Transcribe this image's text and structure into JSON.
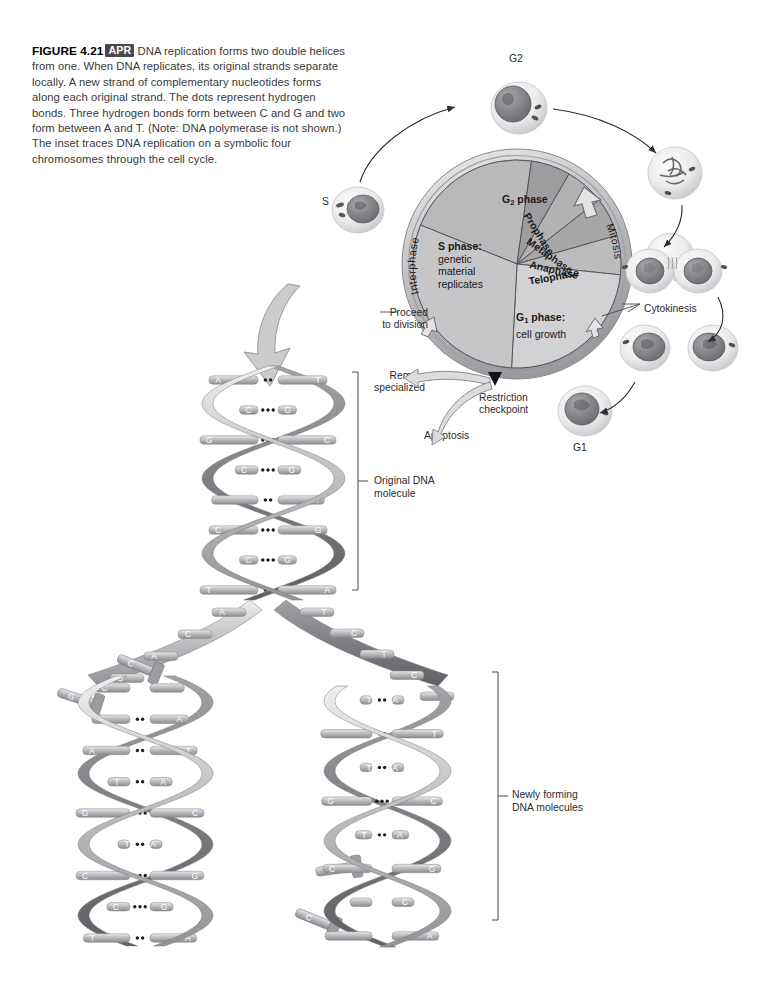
{
  "figure": {
    "number": "FIGURE 4.21",
    "badge": "APR",
    "caption": "DNA replication forms two double helices from one. When DNA replicates, its original strands separate locally. A new strand of complementary nucleotides forms along each original strand. The dots represent hydrogen bonds. Three hydrogen bonds form between C and G and two form between A and T. (Note: DNA polymerase is not shown.) The inset traces DNA replication on a symbolic four chromosomes through the cell cycle."
  },
  "cell_cycle": {
    "arcs": {
      "interphase": "Interphase",
      "mitosis": "Mitosis"
    },
    "sectors": [
      {
        "id": "g2",
        "name": "G",
        "sub": "2",
        "suffix": " phase",
        "start_deg": -68,
        "end_deg": 8,
        "fill": "#b9b9bb"
      },
      {
        "id": "prophase",
        "name": "Prophase",
        "start_deg": 8,
        "end_deg": 30,
        "fill": "#9d9da0"
      },
      {
        "id": "metaphase",
        "name": "Metaphase",
        "start_deg": 30,
        "end_deg": 52,
        "fill": "#b2b2b5"
      },
      {
        "id": "anaphase",
        "name": "Anaphase",
        "start_deg": 52,
        "end_deg": 74,
        "fill": "#a6a6a9"
      },
      {
        "id": "telophase",
        "name": "Telophase",
        "start_deg": 74,
        "end_deg": 96,
        "fill": "#bcbcbf"
      },
      {
        "id": "g1",
        "name": "G",
        "sub": "1",
        "suffix": " phase:",
        "detail": "cell growth",
        "start_deg": 96,
        "end_deg": 183,
        "fill": "#d2d2d4"
      },
      {
        "id": "s",
        "name": "S phase:",
        "detail": "genetic material replicates",
        "start_deg": 183,
        "end_deg": 292,
        "fill": "#c6c6c9"
      }
    ],
    "labels": {
      "g2_phase": "G",
      "g2_sub": "2",
      "g2_suffix": " phase",
      "s_phase_title": "S phase:",
      "s_phase_l1": "genetic",
      "s_phase_l2": "material",
      "s_phase_l3": "replicates",
      "g1_phase": "G",
      "g1_sub": "1",
      "g1_suffix": " phase:",
      "g1_detail": "cell growth",
      "prophase": "Prophase",
      "metaphase": "Metaphase",
      "anaphase": "Anaphase",
      "telophase": "Telophase"
    },
    "annotations": {
      "proceed_l1": "Proceed",
      "proceed_l2": "to division",
      "remain_l1": "Remain",
      "remain_l2": "specialized",
      "apoptosis": "Apoptosis",
      "restriction_l1": "Restriction",
      "restriction_l2": "checkpoint",
      "cytokinesis": "Cytokinesis"
    },
    "cell_captions": {
      "s": "S",
      "g2": "G2",
      "g1": "G1"
    }
  },
  "dna": {
    "labels": {
      "original_l1": "Original DNA",
      "original_l2": "molecule",
      "newly_l1": "Newly forming",
      "newly_l2": "DNA molecules"
    },
    "original_pairs": [
      {
        "left": "A",
        "right": "T",
        "bonds": 2
      },
      {
        "left": "C",
        "right": "G",
        "bonds": 3
      },
      {
        "left": "G",
        "right": "C",
        "bonds": 3
      },
      {
        "left": "C",
        "right": "G",
        "bonds": 3
      },
      {
        "left": "",
        "right": "A",
        "bonds": 2
      },
      {
        "left": "C",
        "right": "G",
        "bonds": 3
      },
      {
        "left": "C",
        "right": "G",
        "bonds": 3
      },
      {
        "left": "T",
        "right": "A",
        "bonds": 2
      }
    ],
    "fork_left_bases": [
      "A",
      "C",
      "A",
      "G"
    ],
    "fork_right_bases": [
      "T",
      "C",
      "T",
      "C",
      "G"
    ],
    "free_nucleotides_left": [
      "C",
      "G"
    ],
    "free_nucleotides_right": [
      "C",
      "C"
    ],
    "left_helix_pairs": [
      {
        "left": "C",
        "right": "",
        "bonds": 0
      },
      {
        "left": "T",
        "right": "A",
        "bonds": 2
      },
      {
        "left": "A",
        "right": "T",
        "bonds": 2
      },
      {
        "left": "T",
        "right": "A",
        "bonds": 2
      },
      {
        "left": "G",
        "right": "C",
        "bonds": 3
      },
      {
        "left": "T",
        "right": "A",
        "bonds": 2
      },
      {
        "left": "C",
        "right": "G",
        "bonds": 3
      },
      {
        "left": "C",
        "right": "G",
        "bonds": 3
      },
      {
        "left": "T",
        "right": "A",
        "bonds": 2
      }
    ],
    "right_helix_pairs": [
      {
        "left": "T",
        "right": "A",
        "bonds": 2
      },
      {
        "left": "",
        "right": "T",
        "bonds": 2
      },
      {
        "left": "T",
        "right": "A",
        "bonds": 2
      },
      {
        "left": "G",
        "right": "C",
        "bonds": 3
      },
      {
        "left": "T",
        "right": "A",
        "bonds": 2
      },
      {
        "left": "C",
        "right": "G",
        "bonds": 0
      },
      {
        "left": "",
        "right": "C",
        "bonds": 0
      },
      {
        "left": "",
        "right": "A",
        "bonds": 0
      }
    ]
  },
  "colors": {
    "ink": "#231f20",
    "caption_text": "#3a3a3c",
    "badge_bg": "#4a4a4c",
    "wheel_rim": "#b4b4b7",
    "ribbon_light": "#d8d8da",
    "ribbon_dark": "#8e8e92",
    "rung": "#a9a9ad"
  }
}
